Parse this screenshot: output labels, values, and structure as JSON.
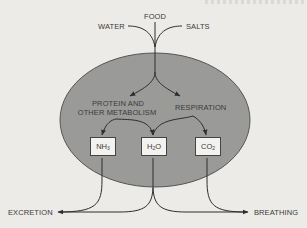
{
  "colors": {
    "background": "#ecebe8",
    "cell_fill": "#9a9a98",
    "cell_stroke": "#555555",
    "line": "#2e2e2e",
    "box_fill": "#f3f2ef",
    "text": "#3a3a3a"
  },
  "inputs": {
    "water": "WATER",
    "food": "FOOD",
    "salts": "SALTS"
  },
  "processes": {
    "metabolism_line1": "PROTEIN AND",
    "metabolism_line2": "OTHER METABOLISM",
    "respiration": "RESPIRATION"
  },
  "products": [
    {
      "base": "NH",
      "sub": "3"
    },
    {
      "base": "H",
      "sub": "2",
      "tail": "O"
    },
    {
      "base": "CO",
      "sub": "2"
    }
  ],
  "outputs": {
    "excretion": "EXCRETION",
    "breathing": "BREATHING"
  }
}
